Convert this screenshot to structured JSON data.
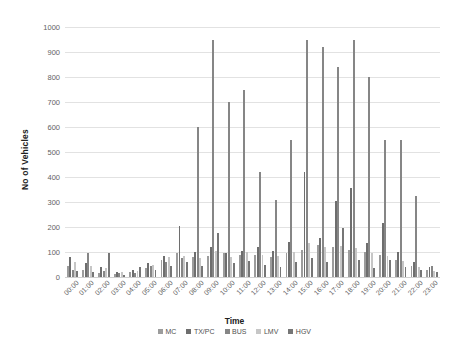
{
  "chart_data": {
    "type": "bar",
    "title": "",
    "xlabel": "Time",
    "ylabel": "No of Vehicles",
    "ylim": [
      0,
      1000
    ],
    "ytick_step": 100,
    "yticks": [
      0,
      100,
      200,
      300,
      400,
      500,
      600,
      700,
      800,
      900,
      1000
    ],
    "grid": true,
    "legend_position": "bottom",
    "categories": [
      "00:00",
      "01:00",
      "02:00",
      "03:00",
      "04:00",
      "05:00",
      "06:00",
      "07:00",
      "08:00",
      "09:00",
      "10:00",
      "11:00",
      "12:00",
      "13:00",
      "14:00",
      "15:00",
      "16:00",
      "17:00",
      "18:00",
      "19:00",
      "20:00",
      "21:00",
      "22:00",
      "23:00"
    ],
    "series": [
      {
        "name": "MC",
        "color": "#9c9c9c",
        "values": [
          45,
          30,
          18,
          12,
          20,
          35,
          70,
          95,
          80,
          85,
          95,
          90,
          90,
          80,
          95,
          110,
          130,
          120,
          110,
          100,
          90,
          70,
          45,
          30
        ]
      },
      {
        "name": "TX/PC",
        "color": "#6e6e6e",
        "values": [
          80,
          55,
          40,
          22,
          28,
          55,
          85,
          205,
          100,
          120,
          95,
          105,
          120,
          105,
          140,
          420,
          155,
          305,
          355,
          135,
          215,
          100,
          60,
          40
        ]
      },
      {
        "name": "BUS",
        "color": "#868686",
        "values": [
          30,
          95,
          25,
          15,
          18,
          45,
          60,
          75,
          600,
          950,
          700,
          750,
          420,
          310,
          550,
          950,
          920,
          840,
          950,
          800,
          550,
          550,
          325,
          45
        ]
      },
      {
        "name": "LMV",
        "color": "#c6c6c6",
        "values": [
          60,
          45,
          35,
          20,
          25,
          50,
          80,
          85,
          75,
          105,
          80,
          100,
          90,
          85,
          100,
          135,
          120,
          125,
          115,
          95,
          85,
          65,
          40,
          25
        ]
      },
      {
        "name": "HGV",
        "color": "#767676",
        "values": [
          25,
          20,
          95,
          10,
          40,
          30,
          45,
          60,
          45,
          175,
          55,
          65,
          50,
          40,
          60,
          75,
          60,
          195,
          70,
          35,
          70,
          40,
          30,
          20
        ]
      }
    ]
  },
  "legend": {
    "items": [
      {
        "label": "MC"
      },
      {
        "label": "TX/PC"
      },
      {
        "label": "BUS"
      },
      {
        "label": "LMV"
      },
      {
        "label": "HGV"
      }
    ]
  }
}
